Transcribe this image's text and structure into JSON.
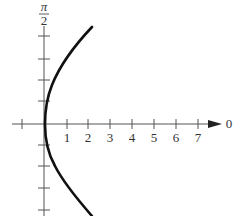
{
  "diagram": {
    "type": "polar-graph",
    "colors": {
      "axis": "#555555",
      "curve": "#111111",
      "text": "#333333"
    },
    "vertical_axis": {
      "label_numerator": "π",
      "label_denominator": "2"
    },
    "horizontal_axis": {
      "tick_labels": [
        "1",
        "2",
        "3",
        "4",
        "5",
        "6",
        "7"
      ],
      "end_label": "0"
    }
  }
}
